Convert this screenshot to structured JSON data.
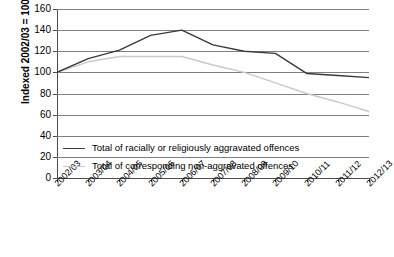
{
  "chart_data": {
    "type": "line",
    "title": "",
    "xlabel": "",
    "ylabel": "Indexed 2002/03 = 100",
    "ylim": [
      0,
      160
    ],
    "ytick_step": 20,
    "yticks": [
      0,
      20,
      40,
      60,
      80,
      100,
      120,
      140,
      160
    ],
    "grid": true,
    "legend_position": "inside-lower-left",
    "categories": [
      "2002/03",
      "2003/04",
      "2004/05",
      "2005/06",
      "2006/07",
      "2007/08",
      "2008/09",
      "2009/10",
      "2010/11",
      "2011/12",
      "2012/13"
    ],
    "series": [
      {
        "name": "Total of racially or religiously aggravated offences",
        "color": "#3a3a3a",
        "values": [
          100,
          113,
          121,
          135,
          140,
          126,
          120,
          118,
          99,
          97,
          95
        ]
      },
      {
        "name": "Total of corresponding non-aggravated offences",
        "color": "#c9c9c9",
        "values": [
          100,
          110,
          115,
          115,
          115,
          107,
          100,
          90,
          80,
          72,
          63
        ]
      }
    ]
  },
  "legend": {
    "items": [
      {
        "label": "Total of racially or religiously aggravated offences",
        "color": "#3a3a3a"
      },
      {
        "label": "Total of corresponding non-aggravated offences",
        "color": "#c9c9c9"
      }
    ]
  },
  "colors": {
    "aggravated_line": "#3a3a3a",
    "non_aggravated_line": "#c9c9c9",
    "gridline": "#808080",
    "axis": "#4d4d4d",
    "background": "#ffffff"
  }
}
